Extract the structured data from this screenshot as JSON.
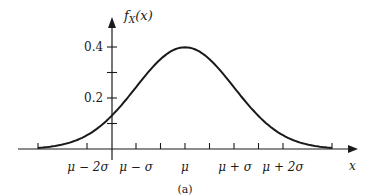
{
  "figure": {
    "caption": "(a)",
    "y_axis_label": "f_X(x)",
    "y_axis_label_main": "f",
    "y_axis_label_sub": "X",
    "y_axis_label_arg": "(x)",
    "x_axis_label": "x",
    "y_tick_labels": [
      "0.4",
      "0.2"
    ],
    "x_tick_labels": [
      "μ − 2σ",
      "μ − σ",
      "μ",
      "μ + σ",
      "μ + 2σ"
    ]
  },
  "chart_data": {
    "type": "line",
    "title": "",
    "caption": "(a)",
    "xlabel": "x",
    "ylabel": "f_X(x)",
    "x_ticks": [
      "μ − 2σ",
      "μ − σ",
      "μ",
      "μ + σ",
      "μ + 2σ"
    ],
    "x_unlabeled_ticks": [
      "μ − 3σ",
      "μ − 2.5σ",
      "μ − 1.5σ",
      "μ − 0.5σ",
      "μ + 0.5σ",
      "μ + 1.5σ",
      "μ + 2.5σ",
      "μ + 3σ"
    ],
    "y_ticks": [
      0.1,
      0.2,
      0.3,
      0.4
    ],
    "y_tick_labels": [
      "0.2",
      "0.4"
    ],
    "ylim": [
      0,
      0.42
    ],
    "xlim_sigma_units": [
      -3.5,
      3.5
    ],
    "grid": false,
    "legend": null,
    "series": [
      {
        "name": "f_X(x)",
        "x_sigma_units": [
          -3,
          -2.5,
          -2,
          -1.5,
          -1,
          -0.5,
          0,
          0.5,
          1,
          1.5,
          2,
          2.5,
          3
        ],
        "values": [
          0.004,
          0.018,
          0.054,
          0.13,
          0.242,
          0.352,
          0.399,
          0.352,
          0.242,
          0.13,
          0.054,
          0.018,
          0.004
        ]
      }
    ]
  }
}
